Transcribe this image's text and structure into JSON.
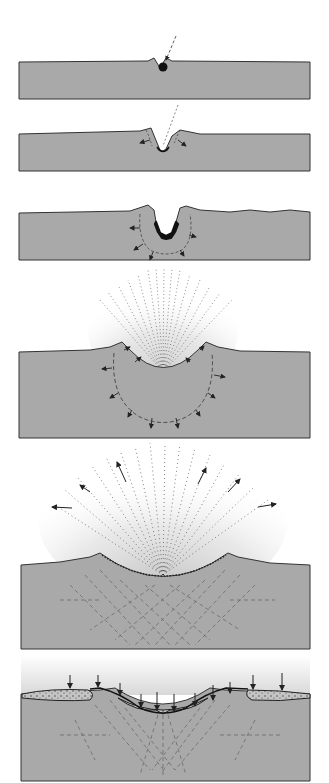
{
  "diagram": {
    "panel_count": 6,
    "colors": {
      "background": "#ffffff",
      "ground": "#a9a9a9",
      "outline": "#333333",
      "projectile": "#111111",
      "ejecta": "#2a2a2a",
      "ejecta_haze": "#cfcfcf",
      "fracture": "#555555",
      "breccia": "#bdbdbd"
    },
    "panels": [
      {
        "id": 1,
        "stage": "contact",
        "description": "Projectile strikes the surface along an oblique trajectory"
      },
      {
        "id": 2,
        "stage": "penetration",
        "description": "Projectile penetrates and compresses the target, rim begins to lift"
      },
      {
        "id": 3,
        "stage": "compression",
        "description": "Shock wave radiates outward from the melting projectile"
      },
      {
        "id": 4,
        "stage": "excavation",
        "description": "Ejecta curtain sprays upward while the transient cavity expands"
      },
      {
        "id": 5,
        "stage": "ejecta-fan",
        "description": "Ejecta spreads widely; target rock below is fractured"
      },
      {
        "id": 6,
        "stage": "modification",
        "description": "Ejecta falls back, forming an ejecta blanket and breccia lens"
      }
    ]
  }
}
